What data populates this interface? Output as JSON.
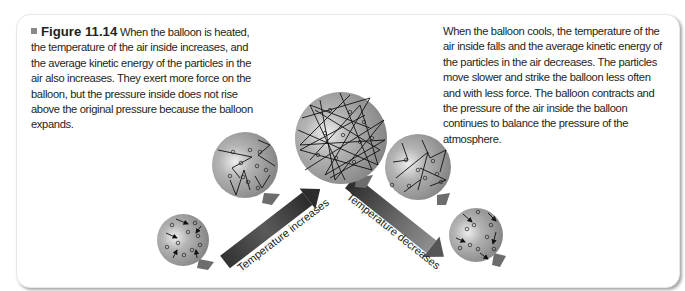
{
  "figure": {
    "label": "Figure 11.14",
    "caption_left": "When the balloon is heated, the temperature of the air inside increases, and the average kinetic energy of the particles in the air also increases. They exert more force on the balloon, but the pressure inside does not rise above the original pressure because the balloon expands.",
    "caption_right": "When the balloon cools, the temperature of the air inside falls and the average kinetic energy of the particles in the air decreases. The particles move slower and strike the balloon less often and with less force. The balloon contracts and the pressure of the air inside the balloon continues to balance the pressure of the atmosphere."
  },
  "arrows": {
    "up_label": "Temperature increases",
    "down_label": "Temperature decreases"
  },
  "balloons": [
    {
      "id": "small-left",
      "state": "cool",
      "cx": 183,
      "cy": 240,
      "r": 26
    },
    {
      "id": "medium-left",
      "state": "warm",
      "cx": 245,
      "cy": 165,
      "r": 33
    },
    {
      "id": "large-center",
      "state": "hot",
      "cx": 341,
      "cy": 138,
      "r": 46
    },
    {
      "id": "medium-right",
      "state": "warm",
      "cx": 418,
      "cy": 167,
      "r": 33
    },
    {
      "id": "small-right",
      "state": "cool",
      "cx": 476,
      "cy": 235,
      "r": 27
    }
  ],
  "colors": {
    "balloon_fill": "#9a9a9a",
    "balloon_highlight": "#e6e6e6",
    "arrow_dark": "#3a3a3a",
    "arrow_light": "#9c9c9c",
    "text": "#231f20",
    "marker": "#8a8a8a"
  }
}
